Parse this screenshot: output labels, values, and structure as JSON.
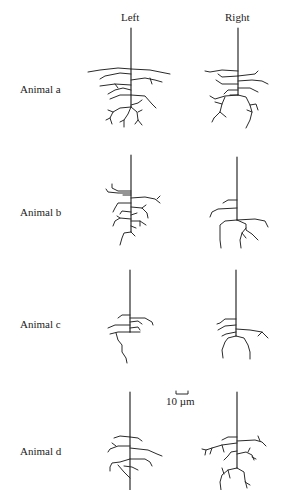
{
  "figure": {
    "columns": [
      {
        "id": "left",
        "label": "Left"
      },
      {
        "id": "right",
        "label": "Right"
      }
    ],
    "rows": [
      {
        "id": "a",
        "label": "Animal a"
      },
      {
        "id": "b",
        "label": "Animal b"
      },
      {
        "id": "c",
        "label": "Animal c"
      },
      {
        "id": "d",
        "label": "Animal d"
      }
    ],
    "scale_bar": {
      "label": "10 µm"
    },
    "colors": {
      "background": "#ffffff",
      "ink": "#2a2a2a"
    }
  }
}
